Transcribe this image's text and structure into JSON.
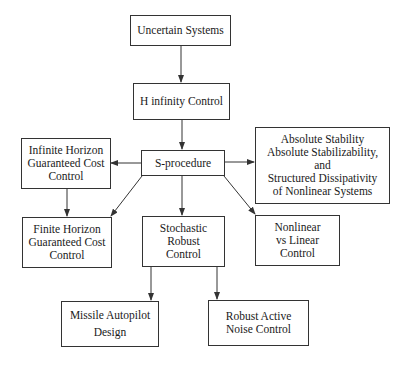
{
  "diagram": {
    "nodes": {
      "uncertain": {
        "lines": [
          "Uncertain Systems"
        ]
      },
      "hinf": {
        "lines": [
          "H infinity Control"
        ]
      },
      "sproc": {
        "lines": [
          "S-procedure"
        ]
      },
      "infinite": {
        "lines": [
          "Infinite Horizon",
          "Guaranteed Cost",
          "Control"
        ]
      },
      "absolute": {
        "lines": [
          "Absolute Stability",
          "Absolute Stabilizability,",
          "and",
          "Structured Dissipativity",
          "of Nonlinear Systems"
        ]
      },
      "finite": {
        "lines": [
          "Finite Horizon",
          "Guaranteed Cost",
          "Control"
        ]
      },
      "stochastic": {
        "lines": [
          "Stochastic",
          "Robust",
          "Control"
        ]
      },
      "nonlinear": {
        "lines": [
          "Nonlinear",
          "vs Linear",
          "Control"
        ]
      },
      "missile": {
        "lines": [
          "Missile Autopilot",
          "Design"
        ]
      },
      "noise": {
        "lines": [
          "Robust Active",
          "Noise Control"
        ]
      }
    },
    "edges": [
      [
        "uncertain",
        "hinf"
      ],
      [
        "hinf",
        "sproc"
      ],
      [
        "sproc",
        "infinite"
      ],
      [
        "sproc",
        "absolute"
      ],
      [
        "sproc",
        "finite"
      ],
      [
        "sproc",
        "stochastic"
      ],
      [
        "sproc",
        "nonlinear"
      ],
      [
        "infinite",
        "finite"
      ],
      [
        "stochastic",
        "missile"
      ],
      [
        "stochastic",
        "noise"
      ]
    ],
    "colors": {
      "line": "#333333",
      "background": "#ffffff",
      "text": "#1a1a1a"
    }
  }
}
